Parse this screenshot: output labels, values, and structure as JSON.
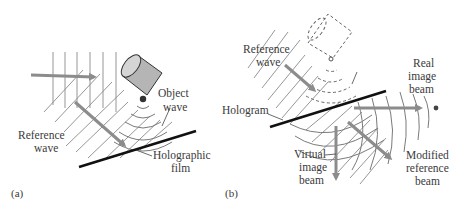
{
  "figure": {
    "panels": [
      {
        "id": "a",
        "label": "(a)",
        "annotations": {
          "object_wave": [
            "Object",
            "wave"
          ],
          "reference_wave": [
            "Reference",
            "wave"
          ],
          "holographic_film": [
            "Holographic",
            "film"
          ]
        }
      },
      {
        "id": "b",
        "label": "(b)",
        "annotations": {
          "reference_wave": [
            "Reference",
            "wave"
          ],
          "hologram": "Hologram",
          "real_image_beam": [
            "Real",
            "image",
            "beam"
          ],
          "virtual_image_beam": [
            "Virtual",
            "image",
            "beam"
          ],
          "modified_reference_beam": [
            "Modified",
            "reference",
            "beam"
          ]
        }
      }
    ],
    "colors": {
      "beam_arrow": "#8c8c8c",
      "object_fill": "#b5b5b5",
      "film": "#111111",
      "hatch": "#8a8a8a",
      "text": "#3a3a3a"
    }
  }
}
